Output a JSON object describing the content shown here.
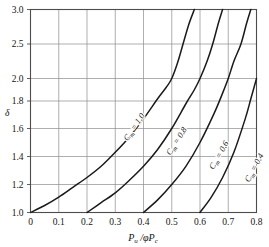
{
  "chart_data": {
    "type": "line",
    "title": "",
    "xlabel": "Pu /φPc",
    "xlabel_parts": {
      "main1": "P",
      "sub1": "u",
      "slash": " /",
      "phi": "φ",
      "main2": "P",
      "sub2": "c"
    },
    "ylabel": "δ",
    "grid": true,
    "legend_position": "inline-on-curves",
    "xlim": [
      0,
      0.8
    ],
    "ylim": [
      1.0,
      3.0
    ],
    "x_ticks": [
      0,
      0.1,
      0.2,
      0.3,
      0.4,
      0.5,
      0.6,
      0.7,
      0.8
    ],
    "x_tick_labels": [
      "0",
      "0.1",
      "0.2",
      "0.3",
      "0.4",
      "0.5",
      "0.6",
      "0.7",
      "0.8"
    ],
    "y_ticks": [
      1.0,
      1.2,
      1.4,
      1.6,
      1.8,
      2.0,
      2.5,
      3.0
    ],
    "y_tick_labels": [
      "1.0",
      "1.2",
      "1.4",
      "1.6",
      "1.8",
      "2.0",
      "2.5",
      "3.0"
    ],
    "y_axis_note": "nonlinear spacing above 1.8",
    "series": [
      {
        "name": "Cm = 1.0",
        "label_prefix": "C",
        "label_sub": "m",
        "label_suffix": " = 1.0",
        "x": [
          0.0,
          0.05,
          0.1,
          0.15,
          0.2,
          0.25,
          0.3,
          0.35,
          0.4,
          0.45,
          0.48,
          0.5
        ],
        "y": [
          1.0,
          1.05,
          1.11,
          1.18,
          1.25,
          1.33,
          1.43,
          1.54,
          1.67,
          1.82,
          1.92,
          2.0
        ]
      },
      {
        "name": "Cm = 0.8",
        "label_prefix": "C",
        "label_sub": "m",
        "label_suffix": " = 0.8",
        "x": [
          0.2,
          0.25,
          0.3,
          0.35,
          0.4,
          0.45,
          0.5,
          0.55,
          0.58,
          0.6
        ],
        "y": [
          1.0,
          1.07,
          1.14,
          1.23,
          1.33,
          1.45,
          1.6,
          1.78,
          1.9,
          2.0
        ]
      },
      {
        "name": "Cm = 0.6",
        "label_prefix": "C",
        "label_sub": "m",
        "label_suffix": " = 0.6",
        "x": [
          0.4,
          0.45,
          0.5,
          0.55,
          0.6,
          0.65,
          0.68,
          0.7
        ],
        "y": [
          1.0,
          1.09,
          1.2,
          1.33,
          1.5,
          1.71,
          1.87,
          2.0
        ]
      },
      {
        "name": "Cm = 0.4",
        "label_prefix": "C",
        "label_sub": "m",
        "label_suffix": " = 0.4",
        "x": [
          0.6,
          0.64,
          0.68,
          0.72,
          0.76,
          0.78,
          0.8
        ],
        "y": [
          1.0,
          1.11,
          1.25,
          1.43,
          1.67,
          1.82,
          2.0
        ]
      }
    ],
    "series_upper": [
      {
        "name": "Cm = 1.0",
        "x": [
          0.5,
          0.52,
          0.54,
          0.56,
          0.58
        ],
        "y": [
          2.0,
          2.22,
          2.5,
          2.78,
          3.0
        ]
      },
      {
        "name": "Cm = 0.8",
        "x": [
          0.6,
          0.625,
          0.645,
          0.665,
          0.68
        ],
        "y": [
          2.0,
          2.25,
          2.5,
          2.8,
          3.0
        ]
      },
      {
        "name": "Cm = 0.6",
        "x": [
          0.7,
          0.72,
          0.745,
          0.765,
          0.78
        ],
        "y": [
          2.0,
          2.25,
          2.5,
          2.8,
          3.0
        ]
      },
      {
        "name": "Cm = 0.4",
        "x": [
          0.8
        ],
        "y": [
          2.0
        ]
      }
    ],
    "colors": {
      "curve": "#1a1a1a",
      "grid": "#8c8c8c",
      "axis": "#4d4d4d",
      "text": "#141414",
      "background": "#ffffff"
    }
  }
}
